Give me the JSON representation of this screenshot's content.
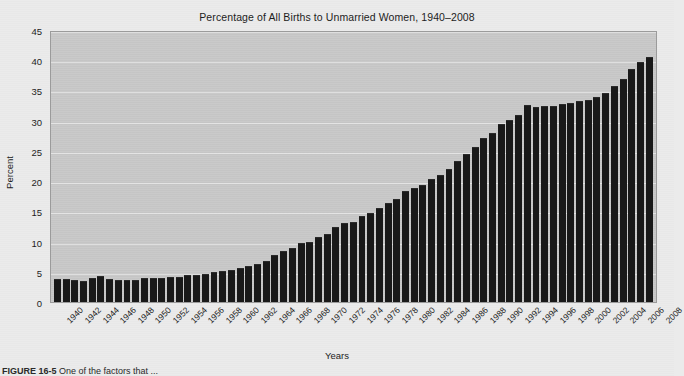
{
  "figure": {
    "caption_label": "FIGURE 16-5",
    "caption_text": "One of the factors that ..."
  },
  "chart_data": {
    "type": "bar",
    "title": "Percentage of All Births to Unmarried Women, 1940–2008",
    "xlabel": "Years",
    "ylabel": "Percent",
    "ylim": [
      0,
      45
    ],
    "yticks": [
      0,
      5,
      10,
      15,
      20,
      25,
      30,
      35,
      40,
      45
    ],
    "grid": true,
    "legend": "none",
    "bar_color": "#191919",
    "plot_background": "#c9c9c9",
    "gridline_color": "#e8e8e8",
    "xtick_step_years": 2,
    "xtick_rotation_deg": -45,
    "categories": [
      "1940",
      "1941",
      "1942",
      "1943",
      "1944",
      "1945",
      "1946",
      "1947",
      "1948",
      "1949",
      "1950",
      "1951",
      "1952",
      "1953",
      "1954",
      "1955",
      "1956",
      "1957",
      "1958",
      "1959",
      "1960",
      "1961",
      "1962",
      "1963",
      "1964",
      "1965",
      "1966",
      "1967",
      "1968",
      "1969",
      "1970",
      "1971",
      "1972",
      "1973",
      "1974",
      "1975",
      "1976",
      "1977",
      "1978",
      "1979",
      "1980",
      "1981",
      "1982",
      "1983",
      "1984",
      "1985",
      "1986",
      "1987",
      "1988",
      "1989",
      "1990",
      "1991",
      "1992",
      "1993",
      "1994",
      "1995",
      "1996",
      "1997",
      "1998",
      "1999",
      "2000",
      "2001",
      "2002",
      "2003",
      "2004",
      "2005",
      "2006",
      "2007",
      "2008"
    ],
    "values": [
      3.8,
      3.8,
      3.6,
      3.5,
      3.9,
      4.3,
      3.8,
      3.6,
      3.7,
      3.7,
      4.0,
      3.9,
      3.9,
      4.1,
      4.2,
      4.5,
      4.5,
      4.7,
      5.0,
      5.2,
      5.3,
      5.6,
      5.9,
      6.3,
      6.8,
      7.7,
      8.4,
      9.0,
      9.7,
      10.0,
      10.7,
      11.3,
      12.4,
      13.0,
      13.2,
      14.2,
      14.8,
      15.5,
      16.3,
      17.1,
      18.4,
      18.9,
      19.4,
      20.3,
      21.0,
      22.0,
      23.4,
      24.5,
      25.7,
      27.1,
      28.0,
      29.5,
      30.1,
      31.0,
      32.6,
      32.2,
      32.4,
      32.4,
      32.8,
      33.0,
      33.2,
      33.5,
      34.0,
      34.6,
      35.8,
      36.9,
      38.5,
      39.7,
      40.6
    ]
  }
}
